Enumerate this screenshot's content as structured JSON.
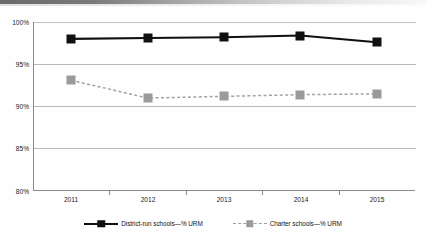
{
  "chart_data": {
    "type": "line",
    "title": "",
    "subtitle": "",
    "xlabel": "",
    "ylabel": "",
    "categories": [
      "2011",
      "2012",
      "2013",
      "2014",
      "2015"
    ],
    "series": [
      {
        "name": "District-run schools—% URM",
        "values": [
          98.0,
          98.1,
          98.2,
          98.4,
          97.6
        ],
        "color": "#101010",
        "line_style": "solid",
        "marker": "square"
      },
      {
        "name": "Charter schools—% URM",
        "values": [
          93.1,
          91.0,
          91.2,
          91.4,
          91.5
        ],
        "color": "#9a9a9a",
        "line_style": "dashed",
        "marker": "square"
      }
    ],
    "ylim": [
      80,
      100
    ],
    "ytick_labels": [
      "80%",
      "85%",
      "90%",
      "95%",
      "100%"
    ],
    "ytick_values": [
      80,
      85,
      90,
      95,
      100
    ],
    "grid": true,
    "legend_position": "bottom"
  },
  "axes": {
    "y_ticks": [
      {
        "label": "100%",
        "value": 100
      },
      {
        "label": "95%",
        "value": 95
      },
      {
        "label": "90%",
        "value": 90
      },
      {
        "label": "85%",
        "value": 85
      },
      {
        "label": "80%",
        "value": 80
      }
    ],
    "x_ticks": [
      {
        "label": "2011"
      },
      {
        "label": "2012"
      },
      {
        "label": "2013"
      },
      {
        "label": "2014"
      },
      {
        "label": "2015"
      }
    ]
  },
  "legend": {
    "items": [
      {
        "label": "District-run schools—% URM",
        "style": "solid",
        "color": "#101010"
      },
      {
        "label": "Charter schools—% URM",
        "style": "dashed",
        "color": "#9a9a9a"
      }
    ]
  }
}
